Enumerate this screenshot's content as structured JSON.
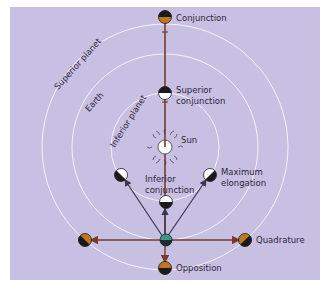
{
  "diagram": {
    "colors": {
      "background": "#c8c0e2",
      "orbit": "#f4f2fb",
      "arrow_dark": "#3a3550",
      "arrow_brown": "#7a3a28",
      "planet_orange": "#c07820",
      "earth": "#3a9a8a"
    },
    "orbit_labels": {
      "superior": "Superior planet",
      "earth": "Earth",
      "inferior": "Inferior planet"
    },
    "positions": {
      "conjunction": "Conjunction",
      "superior_conjunction_1": "Superior",
      "superior_conjunction_2": "conjunction",
      "sun": "Sun",
      "inferior_conjunction_1": "Inferior",
      "inferior_conjunction_2": "conjunction",
      "max_elongation_1": "Maximum",
      "max_elongation_2": "elongation",
      "quadrature": "Quadrature",
      "opposition": "Opposition"
    }
  }
}
